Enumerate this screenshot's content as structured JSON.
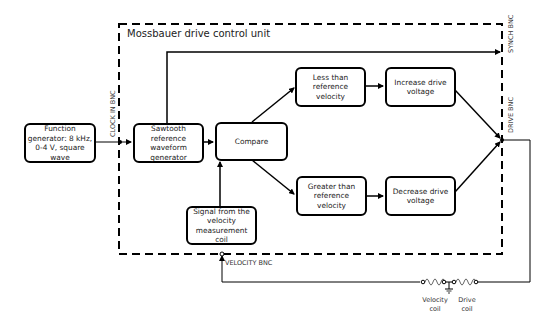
{
  "diagram": {
    "title": "Mossbauer drive control unit",
    "nodes": {
      "function_generator": "Function generator: 8 kHz, 0-4 V, square wave",
      "sawtooth": "Sawtooth reference waveform generator",
      "compare": "Compare",
      "less_than": "Less than reference velocity",
      "greater_than": "Greater than reference velocity",
      "increase": "Increase drive voltage",
      "decrease": "Decrease drive voltage",
      "signal": "Signal from the velocity measurement coil"
    },
    "ports": {
      "clock_in": "CLOCK IN BNC",
      "synch": "SYNCH BNC",
      "drive": "DRIVE BNC",
      "velocity": "VELOCITY BNC"
    },
    "coils": {
      "velocity_line1": "Velocity",
      "velocity_line2": "coil",
      "drive_line1": "Drive",
      "drive_line2": "coil"
    }
  }
}
